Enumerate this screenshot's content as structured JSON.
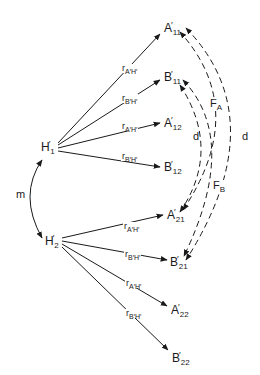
{
  "diagram": {
    "nodes": {
      "H1": {
        "base": "H",
        "prime": "′",
        "sub": "1"
      },
      "H2": {
        "base": "H",
        "prime": "′",
        "sub": "2"
      },
      "A11": {
        "base": "A",
        "prime": "′",
        "sub": "11"
      },
      "B11": {
        "base": "B",
        "prime": "′",
        "sub": "11"
      },
      "A12": {
        "base": "A",
        "prime": "′",
        "sub": "12"
      },
      "B12": {
        "base": "B",
        "prime": "′",
        "sub": "12"
      },
      "A21": {
        "base": "A",
        "prime": "′",
        "sub": "21"
      },
      "B21": {
        "base": "B",
        "prime": "′",
        "sub": "21"
      },
      "A22": {
        "base": "A",
        "prime": "′",
        "sub": "22"
      },
      "B22": {
        "base": "B",
        "prime": "′",
        "sub": "22"
      }
    },
    "edge_labels": {
      "rAH": {
        "base": "r",
        "sub": "A′H′"
      },
      "rBH": {
        "base": "r",
        "sub": "B′H′"
      }
    },
    "edges": [
      {
        "from": "H1",
        "to": "A11",
        "label": "r_A'H'"
      },
      {
        "from": "H1",
        "to": "B11",
        "label": "r_B'H'"
      },
      {
        "from": "H1",
        "to": "A12",
        "label": "r_A'H'"
      },
      {
        "from": "H1",
        "to": "B12",
        "label": "r_B'H'"
      },
      {
        "from": "H2",
        "to": "A21",
        "label": "r_A'H'"
      },
      {
        "from": "H2",
        "to": "B21",
        "label": "r_B'H'"
      },
      {
        "from": "H2",
        "to": "A22",
        "label": "r_A'H'"
      },
      {
        "from": "H2",
        "to": "B22",
        "label": "r_B'H'"
      },
      {
        "from": "H2",
        "to": "H1",
        "label": "m",
        "style": "curved"
      }
    ],
    "dashed_links": [
      {
        "between": [
          "B11",
          "A21"
        ],
        "label": "d"
      },
      {
        "between": [
          "A11",
          "B21"
        ],
        "label": "d"
      },
      {
        "from": "A21",
        "to": "A11",
        "label": "F_A"
      },
      {
        "from": "B11",
        "to": "B21",
        "label": "F_B"
      }
    ],
    "labels": {
      "m": "m",
      "d": "d",
      "FA": {
        "base": "F",
        "sub": "A"
      },
      "FB": {
        "base": "F",
        "sub": "B"
      }
    }
  }
}
